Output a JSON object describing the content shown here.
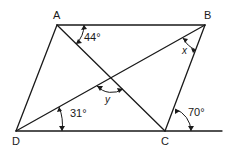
{
  "diagram": {
    "type": "parallelogram-with-diagonals",
    "vertices": {
      "A": "A",
      "B": "B",
      "C": "C",
      "D": "D"
    },
    "angles": {
      "at_A": "44°",
      "at_D": "31°",
      "exterior_C": "70°",
      "x": "x",
      "y": "y"
    },
    "colors": {
      "stroke": "#1a1a1a",
      "background": "#ffffff"
    }
  }
}
